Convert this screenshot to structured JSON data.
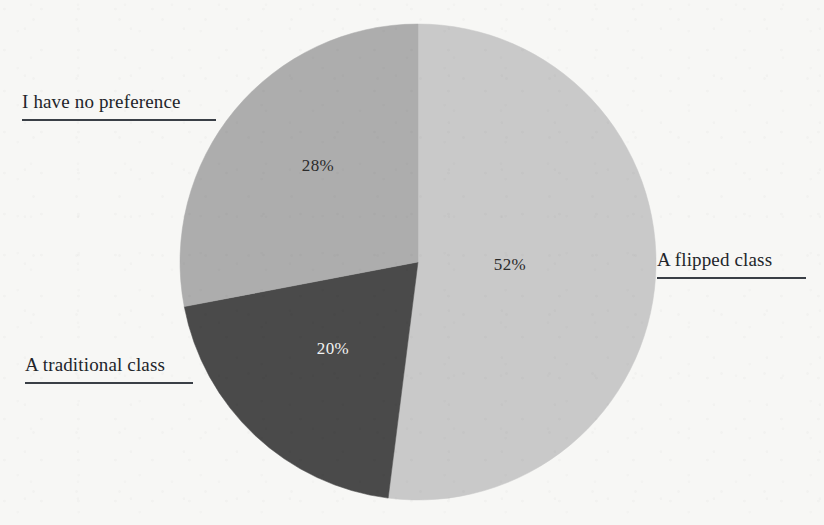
{
  "background_color": "#f7f7f5",
  "chart_data": {
    "type": "pie",
    "title": "",
    "categories": [
      "A flipped class",
      "A traditional class",
      "I have no preference"
    ],
    "values": [
      52,
      20,
      28
    ],
    "value_labels": [
      "52%",
      "20%",
      "28%"
    ],
    "unit": "%",
    "colors": [
      "#c9c9c9",
      "#4a4a4a",
      "#adadad"
    ],
    "label_text_colors": [
      "#2b2b2b",
      "#f2f2f2",
      "#2b2b2b"
    ],
    "start_angle_deg": 0,
    "direction": "clockwise",
    "legend": "none",
    "labels_position": "outside-with-rule",
    "grid": false
  },
  "slices": [
    {
      "name": "A flipped class",
      "value_label": "52%",
      "color": "#c9c9c9",
      "value_x": 510,
      "value_y": 265
    },
    {
      "name": "A traditional class",
      "value_label": "20%",
      "color": "#4a4a4a",
      "value_x": 333,
      "value_y": 349
    },
    {
      "name": "I have no preference",
      "value_label": "28%",
      "color": "#adadad",
      "value_x": 318,
      "value_y": 166
    }
  ],
  "callouts": [
    {
      "name": "I have no preference",
      "text": "I have no preference",
      "x": 22,
      "y": 90,
      "width": 194
    },
    {
      "name": "A traditional class",
      "text": "A traditional class",
      "x": 25,
      "y": 353,
      "width": 168
    },
    {
      "name": "A flipped class",
      "text": "A flipped class",
      "x": 657,
      "y": 248,
      "width": 149
    }
  ],
  "geometry": {
    "center_x": 418,
    "center_y": 262,
    "radius": 238
  }
}
